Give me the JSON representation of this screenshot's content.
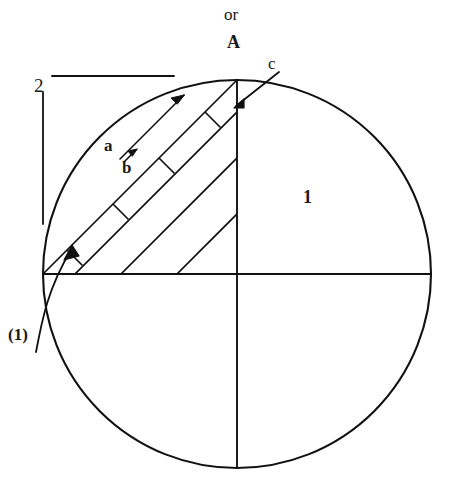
{
  "figure": {
    "title_lines": {
      "or": "or",
      "A": "A"
    },
    "labels": {
      "c": "c",
      "two": "2",
      "a": "a",
      "b": "b",
      "one": "1",
      "paren_one": "(1)"
    },
    "colors": {
      "ink": "#1a1a1a",
      "background": "#ffffff",
      "stroke": "#111111"
    },
    "geometry": {
      "circle": {
        "cx": 237,
        "cy": 274,
        "r": 194
      },
      "horizontal_diameter": {
        "x1": 43,
        "y1": 274,
        "x2": 431,
        "y2": 274
      },
      "vertical_radius": {
        "x1": 237,
        "y1": 80,
        "x2": 237,
        "y2": 468
      },
      "quadrant": "upper-left",
      "chord": {
        "x1": 43,
        "y1": 274,
        "x2": 237,
        "y2": 80
      },
      "diagonal_count": 4,
      "rung_count": 4,
      "bracket": {
        "top_rule": {
          "x1": 52,
          "y1": 76,
          "x2": 174,
          "y2": 76
        },
        "side_rule": {
          "x1": 43,
          "y1": 92,
          "x2": 43,
          "y2": 224
        }
      }
    },
    "annotations": {
      "arrow_a_tip": {
        "x": 183,
        "y": 96
      },
      "arrow_b_tip": {
        "x": 133,
        "y": 150
      },
      "arrow_c_tail": {
        "x": 277,
        "y": 72
      },
      "arrow_c_tip": {
        "x": 235,
        "y": 107
      },
      "arrow_paren1_tip": {
        "x": 73,
        "y": 247
      },
      "arrow_paren1_tail": {
        "x": 39,
        "y": 345
      }
    }
  }
}
